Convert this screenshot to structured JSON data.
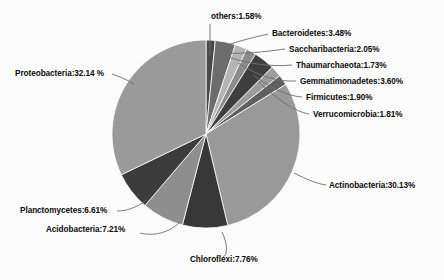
{
  "chart_data": {
    "type": "pie",
    "title": "",
    "subtitle": "",
    "xlabel": "",
    "ylabel": "",
    "legend_position": "none",
    "grid": false,
    "labels_outside": true,
    "label_format": "name:value%",
    "categories": [
      "Proteobacteria",
      "Actinobacteria",
      "Chloroflexi",
      "Acidobacteria",
      "Planctomycetes",
      "Bacteroidetes",
      "Gemmatimonadetes",
      "Saccharibacteria",
      "Firmicutes",
      "Verrucomicrobia",
      "Thaumarchaeota",
      "others"
    ],
    "values": [
      32.14,
      30.13,
      7.76,
      7.21,
      6.61,
      3.48,
      3.6,
      2.05,
      1.9,
      1.81,
      1.73,
      1.58
    ],
    "unit": "%",
    "total": 100.0,
    "slices": [
      {
        "name": "others",
        "value": 1.58,
        "label": "others:1.58%",
        "color": "#4a4a4a",
        "start_angle": 0.0,
        "end_angle": 5.688,
        "label_x": 211,
        "label_y": 19,
        "label_anchor": "start",
        "leader": "M 210 56 L 210 24"
      },
      {
        "name": "Bacteroidetes",
        "value": 3.48,
        "label": "Bacteroidetes:3.48%",
        "color": "#6d6d6d",
        "start_angle": 5.688,
        "end_angle": 18.216,
        "label_x": 272,
        "label_y": 36,
        "label_anchor": "start",
        "leader": "M 216 49 C 232 43, 250 38, 268 34"
      },
      {
        "name": "Saccharibacteria",
        "value": 2.05,
        "label": "Saccharibacteria:2.05%",
        "color": "#b6b6b6",
        "start_angle": 18.216,
        "end_angle": 25.596,
        "label_x": 289,
        "label_y": 52,
        "label_anchor": "start",
        "leader": "M 222 53 C 243 54, 264 52, 285 49"
      },
      {
        "name": "Thaumarchaeota",
        "value": 1.73,
        "label": "Thaumarchaeota:1.73%",
        "color": "#8c8c8c",
        "start_angle": 25.596,
        "end_angle": 31.824,
        "label_x": 296,
        "label_y": 68,
        "label_anchor": "start",
        "leader": "M 228 57 C 250 64, 270 67, 292 65"
      },
      {
        "name": "Gemmatimonadetes",
        "value": 3.6,
        "label": "Gemmatimonadetes:3.60%",
        "color": "#3f3f3f",
        "start_angle": 31.824,
        "end_angle": 44.784,
        "label_x": 300,
        "label_y": 84,
        "label_anchor": "start",
        "leader": "M 238 63 C 258 76, 278 82, 296 81"
      },
      {
        "name": "Firmicutes",
        "value": 1.9,
        "label": "Firmicutes:1.90%",
        "color": "#9d9d9d",
        "start_angle": 44.784,
        "end_angle": 51.624,
        "label_x": 306,
        "label_y": 100,
        "label_anchor": "start",
        "leader": "M 253 75 C 272 89, 288 96, 302 97"
      },
      {
        "name": "Verrucomicrobia",
        "value": 1.81,
        "label": "Verrucomicrobia:1.81%",
        "color": "#606060",
        "start_angle": 51.624,
        "end_angle": 58.14,
        "label_x": 313,
        "label_y": 117,
        "label_anchor": "start",
        "leader": "M 259 82 C 278 100, 296 112, 309 114"
      },
      {
        "name": "Actinobacteria",
        "value": 30.13,
        "label": "Actinobacteria:30.13%",
        "color": "#9a9a9a",
        "start_angle": 58.14,
        "end_angle": 166.608,
        "label_x": 329,
        "label_y": 188,
        "label_anchor": "start",
        "leader": "M 294 173 C 308 180, 318 184, 326 185"
      },
      {
        "name": "Chloroflexi",
        "value": 7.76,
        "label": "Chloroflexi:7.76%",
        "color": "#383838",
        "start_angle": 166.608,
        "end_angle": 194.544,
        "label_x": 190,
        "label_y": 262,
        "label_anchor": "start",
        "leader": "M 222 232 C 228 245, 228 255, 222 258"
      },
      {
        "name": "Acidobacteria",
        "value": 7.21,
        "label": "Acidobacteria:7.21%",
        "color": "#8f8f8f",
        "start_angle": 194.544,
        "end_angle": 220.5,
        "label_x": 46,
        "label_y": 232,
        "label_anchor": "start",
        "leader": "M 180 222 C 168 234, 152 236, 140 233"
      },
      {
        "name": "Planctomycetes",
        "value": 6.61,
        "label": "Planctomycetes:6.61%",
        "color": "#3c3c3c",
        "start_angle": 220.5,
        "end_angle": 244.296,
        "label_x": 20,
        "label_y": 213,
        "label_anchor": "start",
        "leader": "M 147 200 C 136 208, 126 211, 117 211"
      },
      {
        "name": "Proteobacteria",
        "value": 32.14,
        "label": "Proteobacteria:32.14 %",
        "color": "#9b9b9b",
        "start_angle": 244.296,
        "end_angle": 360.0,
        "label_x": 15,
        "label_y": 76,
        "label_anchor": "start",
        "leader": "M 134 84 C 126 79, 118 76, 112 74"
      }
    ],
    "geometry": {
      "center_x": 206,
      "center_y": 134,
      "radius": 94,
      "start_at_top": true,
      "direction": "clockwise"
    },
    "colors": {
      "background": "#fdfdfd",
      "label_text": "#0b0b0b",
      "leader_line": "#6e6e6e",
      "slice_border": "#ffffff"
    }
  }
}
